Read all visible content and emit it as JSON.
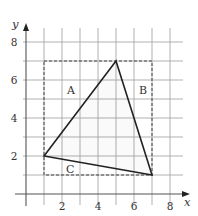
{
  "figure": {
    "x_axis": {
      "label": "x",
      "ticks": [
        "2",
        "4",
        "6",
        "8"
      ],
      "tick_values": [
        2,
        4,
        6,
        8
      ],
      "min": 0,
      "max": 8
    },
    "y_axis": {
      "label": "y",
      "ticks": [
        "2",
        "4",
        "6",
        "8"
      ],
      "tick_values": [
        2,
        4,
        6,
        8
      ],
      "min": 0,
      "max": 8
    },
    "grid": {
      "step": 1,
      "x_lines": [
        1,
        2,
        3,
        4,
        5,
        6,
        7,
        8
      ],
      "y_lines": [
        1,
        2,
        3,
        4,
        5,
        6,
        7,
        8
      ]
    },
    "triangle": {
      "vertices": [
        [
          1,
          2
        ],
        [
          5,
          7
        ],
        [
          7,
          1
        ]
      ]
    },
    "bounding_box": {
      "x1": 1,
      "y1": 1,
      "x2": 7,
      "y2": 7,
      "style": "dashed"
    },
    "regions": [
      {
        "label": "A",
        "at": [
          2.5,
          5.5
        ]
      },
      {
        "label": "B",
        "at": [
          6.5,
          5.5
        ]
      },
      {
        "label": "C",
        "at": [
          2.45,
          1.3
        ]
      }
    ],
    "colors": {
      "grid": "#a8a8a8",
      "axis": "#555555",
      "triangle": "#222222",
      "dashed": "#444444"
    }
  }
}
